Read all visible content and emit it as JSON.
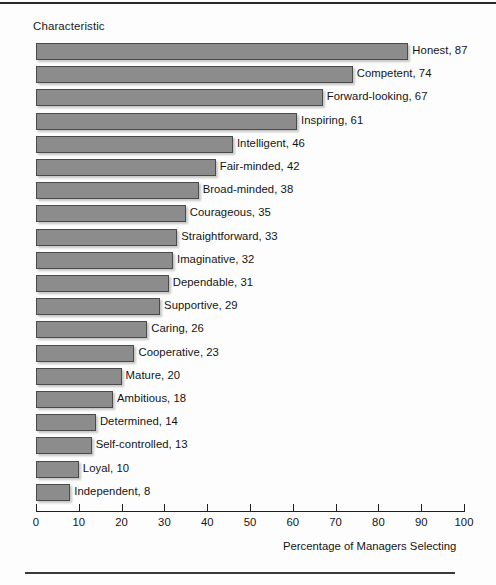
{
  "chart_data": {
    "type": "bar",
    "orientation": "horizontal",
    "title": "",
    "ylabel": "Characteristic",
    "xlabel": "Percentage of Managers Selecting",
    "xlim": [
      0,
      100
    ],
    "xticks": [
      0,
      10,
      20,
      30,
      40,
      50,
      60,
      70,
      80,
      90,
      100
    ],
    "grid": false,
    "legend": null,
    "categories": [
      "Honest",
      "Competent",
      "Forward-looking",
      "Inspiring",
      "Intelligent",
      "Fair-minded",
      "Broad-minded",
      "Courageous",
      "Straightforward",
      "Imaginative",
      "Dependable",
      "Supportive",
      "Caring",
      "Cooperative",
      "Mature",
      "Ambitious",
      "Determined",
      "Self-controlled",
      "Loyal",
      "Independent"
    ],
    "values": [
      87,
      74,
      67,
      61,
      46,
      42,
      38,
      35,
      33,
      32,
      31,
      29,
      26,
      23,
      20,
      18,
      14,
      13,
      10,
      8
    ],
    "data_labels": [
      "Honest, 87",
      "Competent, 74",
      "Forward-looking, 67",
      "Inspiring, 61",
      "Intelligent, 46",
      "Fair-minded, 42",
      "Broad-minded, 38",
      "Courageous, 35",
      "Straightforward, 33",
      "Imaginative, 32",
      "Dependable, 31",
      "Supportive, 29",
      "Caring, 26",
      "Cooperative, 23",
      "Mature, 20",
      "Ambitious, 18",
      "Determined, 14",
      "Self-controlled, 13",
      "Loyal, 10",
      "Independent, 8"
    ],
    "colors": {
      "bar_fill": "#8c8c8c",
      "bar_border": "#4a4a4a",
      "text": "#141414",
      "axis": "#1f1f1f",
      "background": "#fdfdfd"
    }
  }
}
